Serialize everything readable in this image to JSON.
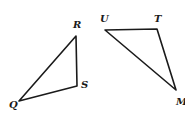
{
  "figure": {
    "width": 185,
    "height": 120,
    "stroke_color": "#1a1a1a",
    "background": "#ffffff",
    "triangles": [
      {
        "name": "triangle-QRS",
        "vertices": [
          {
            "label": "R",
            "x": 76,
            "y": 36,
            "label_x": 73,
            "label_y": 28
          },
          {
            "label": "S",
            "x": 77,
            "y": 86,
            "label_x": 81,
            "label_y": 88
          },
          {
            "label": "Q",
            "x": 19,
            "y": 101,
            "label_x": 9,
            "label_y": 108
          }
        ]
      },
      {
        "name": "triangle-UTM",
        "vertices": [
          {
            "label": "U",
            "x": 105,
            "y": 30,
            "label_x": 100,
            "label_y": 22
          },
          {
            "label": "T",
            "x": 157,
            "y": 29,
            "label_x": 154,
            "label_y": 22
          },
          {
            "label": "M",
            "x": 176,
            "y": 90,
            "label_x": 176,
            "label_y": 105
          }
        ]
      }
    ]
  }
}
